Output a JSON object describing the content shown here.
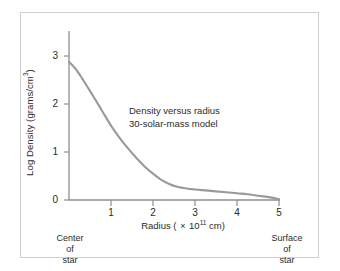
{
  "chart_data": {
    "type": "line",
    "title": "",
    "annotation_lines": [
      "Density versus radius",
      "30-solar-mass model"
    ],
    "xlabel_parts": {
      "prefix": "Radius ( ",
      "times": "×",
      "mantissa": " 10",
      "exponent": "11",
      "suffix": " cm)"
    },
    "xlabel_plain": "Radius ( × 10^11 cm)",
    "ylabel_parts": {
      "prefix": "Log Density (grams/cm",
      "exponent": "3",
      "suffix": ")"
    },
    "ylabel_plain": "Log Density (grams/cm^3)",
    "xticks": [
      "1",
      "2",
      "3",
      "4",
      "5"
    ],
    "xtick_values": [
      1,
      2,
      3,
      4,
      5
    ],
    "yticks": [
      "0",
      "1",
      "2",
      "3"
    ],
    "ytick_values": [
      0,
      1,
      2,
      3
    ],
    "xlim": [
      0,
      5
    ],
    "ylim": [
      0,
      3
    ],
    "grid": false,
    "legend": "none",
    "series": [
      {
        "name": "30-solar-mass model density profile",
        "x": [
          0.0,
          0.15,
          0.3,
          0.45,
          0.6,
          0.8,
          1.0,
          1.2,
          1.4,
          1.6,
          1.8,
          2.0,
          2.2,
          2.4,
          2.6,
          2.8,
          3.0,
          3.25,
          3.5,
          3.75,
          4.0,
          4.25,
          4.5,
          4.75,
          5.0
        ],
        "y": [
          2.88,
          2.74,
          2.55,
          2.34,
          2.13,
          1.84,
          1.55,
          1.3,
          1.08,
          0.88,
          0.7,
          0.55,
          0.42,
          0.33,
          0.27,
          0.24,
          0.22,
          0.2,
          0.18,
          0.16,
          0.14,
          0.12,
          0.09,
          0.06,
          0.02
        ]
      }
    ],
    "endpoint_captions": {
      "left": [
        "Center",
        "of",
        "star"
      ],
      "right": [
        "Surface",
        "of",
        "star"
      ]
    },
    "colors": {
      "curve": "#9a9a9a",
      "axis": "#8e8e8e",
      "text": "#2b2b2b",
      "frame": "#cfcfcf",
      "background": "#ffffff"
    }
  }
}
